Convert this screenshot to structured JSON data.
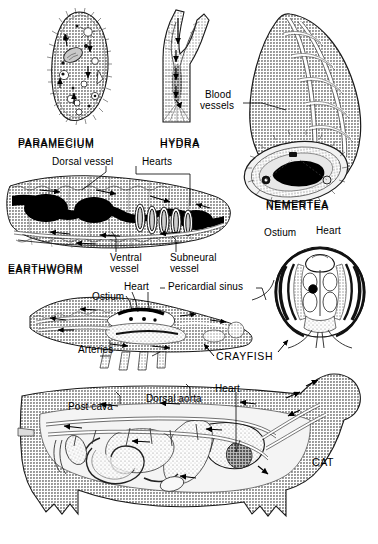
{
  "figure": {
    "background_color": "#ffffff",
    "ink_color": "#000000",
    "tissue_gray": "#9a9a9a",
    "tissue_gray_light": "#bdbdbd",
    "tissue_gray_dark": "#6e6e6e",
    "vessel_black": "#000000"
  },
  "organisms": {
    "paramecium": {
      "caption": "PARAMECIUM"
    },
    "hydra": {
      "caption": "HYDRA"
    },
    "nemertea": {
      "caption": "NEMERTEA",
      "labels": {
        "blood_vessels_line1": "Blood",
        "blood_vessels_line2": "vessels"
      }
    },
    "earthworm": {
      "caption": "EARTHWORM",
      "labels": {
        "dorsal_vessel": "Dorsal vessel",
        "hearts": "Hearts",
        "ventral_line1": "Ventral",
        "ventral_line2": "vessel",
        "subneural_line1": "Subneural",
        "subneural_line2": "vessel"
      }
    },
    "crayfish": {
      "caption": "CRAYFISH",
      "labels": {
        "ostium": "Ostium",
        "heart": "Heart",
        "pericardial_sinus": "Pericardial sinus",
        "arteries": "Arteries"
      },
      "cross_section_labels": {
        "ostium": "Ostium",
        "heart": "Heart"
      }
    },
    "cat": {
      "caption": "CAT",
      "labels": {
        "post_cava": "Post cava",
        "dorsal_aorta": "Dorsal aorta",
        "heart": "Heart"
      }
    }
  }
}
